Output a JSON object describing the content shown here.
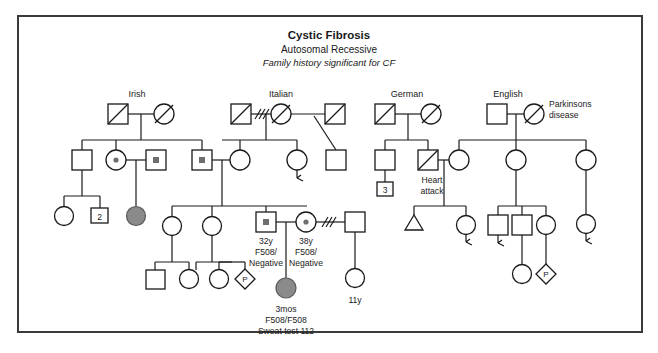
{
  "header": {
    "title": "Cystic Fibrosis",
    "inheritance": "Autosomal Recessive",
    "note": "Family history significant for CF"
  },
  "ethnicity_labels": {
    "irish": "Irish",
    "italian": "Italian",
    "german": "German",
    "english": "English"
  },
  "annotations": {
    "parkinsons_line1": "Parkinsons",
    "parkinsons_line2": "disease",
    "heart_line1": "Heart",
    "heart_line2": "attack",
    "father_age": "32y",
    "father_geno_line1": "F508/",
    "father_geno_line2": "Negative",
    "mother_age": "38y",
    "mother_geno_line1": "F508/",
    "mother_geno_line2": "Negative",
    "proband_age": "3mos",
    "proband_geno": "F508/F508",
    "proband_sweat": "Sweat test 112",
    "halfsib_age": "11y"
  },
  "sibship_counts": {
    "irish_branch": "2",
    "german_branch": "3"
  },
  "pregnancy_marks": {
    "left": "P",
    "right": "P"
  },
  "legend_meaning": {
    "square": "male",
    "circle": "female",
    "diamond": "pregnancy-unknown-sex",
    "triangle": "spontaneous-abortion",
    "filled": "affected",
    "center-dot": "carrier",
    "diagonal-slash": "deceased",
    "double-slash-line": "divorced-separated",
    "numbered-box": "number-of-siblings",
    "hook-line": "no-offspring"
  },
  "colors": {
    "stroke": "#1a1a1a",
    "affected_fill": "#8a8a8a",
    "carrier_dot": "#6e6e6e",
    "frame": "#3a3a3c",
    "background": "#ffffff"
  }
}
